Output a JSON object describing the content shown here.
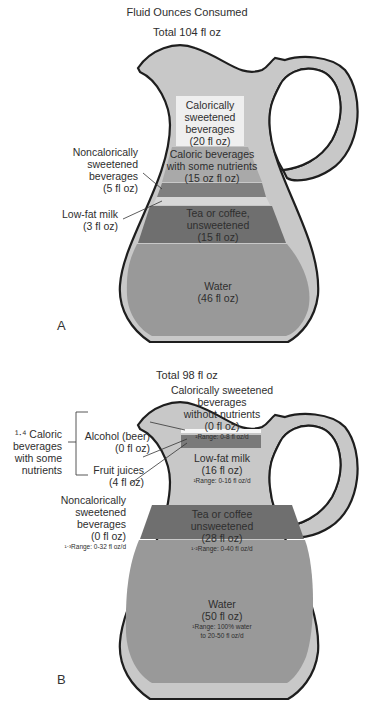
{
  "title": "Fluid Ounces Consumed",
  "panel_a": {
    "letter": "A",
    "total": "Total 104 fl oz",
    "layers": [
      {
        "name": "calorically-sweetened",
        "lines": [
          "Calorically",
          "sweetened",
          "beverages",
          "(20 fl oz)"
        ],
        "value_floz": 20,
        "color": "#efefef"
      },
      {
        "name": "caloric-with-nutrients",
        "lines": [
          "Caloric beverages",
          "with some nutrients",
          "(15 oz fl oz)"
        ],
        "value_floz": 15,
        "color": "#a9a9a9"
      },
      {
        "name": "noncalorically-sweetened",
        "value_floz": 5,
        "color": "#7f7f7f"
      },
      {
        "name": "low-fat-milk",
        "value_floz": 3,
        "color": "#d7d7d7"
      },
      {
        "name": "tea-coffee",
        "lines": [
          "Tea or coffee,",
          "unsweetened",
          "(15 fl oz)"
        ],
        "value_floz": 15,
        "color": "#6f6f6f"
      },
      {
        "name": "water",
        "lines": [
          "Water",
          "(46 fl oz)"
        ],
        "value_floz": 46,
        "color": "#999999"
      }
    ],
    "callouts": {
      "noncalorically": [
        "Noncalorically",
        "sweetened",
        "beverages",
        "(5 fl oz)"
      ],
      "lowfat": [
        "Low-fat milk",
        "(3 fl oz)"
      ]
    }
  },
  "panel_b": {
    "letter": "B",
    "total": "Total 98 fl oz",
    "layers": [
      {
        "name": "calorically-sweetened-without-nutrients",
        "lines": [
          "Calorically sweetened",
          "beverages",
          "without nutrients",
          "(0 fl oz)"
        ],
        "range": "¹Range: 0-8 fl oz/d",
        "value_floz": 0
      },
      {
        "name": "alcohol",
        "value_floz": 0,
        "color": "#f7f7f7"
      },
      {
        "name": "fruit-juices",
        "value_floz": 4,
        "color": "#7a7a7a"
      },
      {
        "name": "low-fat-milk",
        "lines": [
          "Low-fat milk",
          "(16 fl oz)"
        ],
        "range": "¹Range: 0-16 fl oz/d",
        "value_floz": 16,
        "color": "#c9c9c9"
      },
      {
        "name": "tea-coffee",
        "lines": [
          "Tea or coffee",
          "unsweetened",
          "(28 fl oz)"
        ],
        "range": "¹·²Range: 0-40 fl oz/d",
        "value_floz": 28,
        "color": "#6f6f6f"
      },
      {
        "name": "water",
        "lines": [
          "Water",
          "(50 fl oz)"
        ],
        "range_lines": [
          "¹Range: 100% water",
          "to 20-50 fl oz/d"
        ],
        "value_floz": 50,
        "color": "#999999"
      }
    ],
    "bracket_label": [
      "¹·⁴ Caloric",
      "beverages",
      "with some",
      "nutrients"
    ],
    "callouts": {
      "alcohol": [
        "Alcohol (beer)",
        "(0 fl oz)"
      ],
      "fruit": [
        "Fruit juices",
        "(4 fl oz)"
      ],
      "noncalorically": [
        "Noncalorically",
        "sweetened",
        "beverages",
        "(0 fl oz)"
      ],
      "noncal_range": "¹·³Range: 0-32 fl oz/d"
    }
  },
  "colors": {
    "outline": "#1e1e1e",
    "glass": "#c8c8c8",
    "light_layer": "#efefef",
    "mid_layer": "#a9a9a9",
    "dark_layer": "#6f6f6f",
    "water": "#999999"
  }
}
